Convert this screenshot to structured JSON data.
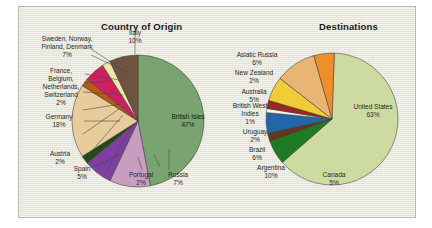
{
  "figure": {
    "background_color": "#e8e7dc",
    "border_color": "#b9b8ad"
  },
  "chart_data": [
    {
      "type": "pie",
      "title": "Country of Origin",
      "position": "left",
      "legend": "labels-outside-with-leader-lines",
      "categories": [
        "British Isles",
        "Italy",
        "Sweden, Norway, Finland, Denmark",
        "France, Belgium, Netherlands, Switzerland",
        "Germany",
        "Austria",
        "Spain",
        "Portugal",
        "Russia"
      ],
      "values": [
        47,
        10,
        7,
        2,
        18,
        2,
        5,
        2,
        7
      ],
      "value_labels": [
        "47%",
        "10%",
        "7%",
        "2%",
        "18%",
        "2%",
        "5%",
        "2%",
        "7%"
      ],
      "colors": [
        "#79a472",
        "#c79ec0",
        "#7e3fa0",
        "#1f4a16",
        "#e8cc9b",
        "#b35c12",
        "#cf1f62",
        "#ece9a8",
        "#6f5240"
      ],
      "labels": [
        {
          "key": "british-isles",
          "text": "British Isles\n47%",
          "placement": "inside"
        },
        {
          "key": "italy",
          "text": "Italy\n10%",
          "placement": "outside"
        },
        {
          "key": "scandinavia",
          "text": "Sweden, Norway,\nFinland, Denmark\n7%",
          "placement": "outside"
        },
        {
          "key": "low-countries",
          "text": "France,\nBelgium,\nNetherlands,\nSwitzerland\n2%",
          "placement": "outside"
        },
        {
          "key": "germany",
          "text": "Germany\n18%",
          "placement": "outside"
        },
        {
          "key": "austria",
          "text": "Austria\n2%",
          "placement": "outside"
        },
        {
          "key": "spain",
          "text": "Spain\n5%",
          "placement": "outside"
        },
        {
          "key": "portugal",
          "text": "Portugal\n2%",
          "placement": "outside"
        },
        {
          "key": "russia",
          "text": "Russia\n7%",
          "placement": "outside"
        }
      ]
    },
    {
      "type": "pie",
      "title": "Destinations",
      "position": "right",
      "legend": "labels-outside-with-leader-lines",
      "categories": [
        "United States",
        "Asiatic Russia",
        "New Zealand",
        "Australia",
        "British West Indies",
        "Uruguay",
        "Brazil",
        "Argentina",
        "Canada"
      ],
      "values": [
        63,
        6,
        2,
        5,
        1,
        2,
        6,
        10,
        5
      ],
      "value_labels": [
        "63%",
        "6%",
        "2%",
        "5%",
        "1%",
        "2%",
        "6%",
        "10%",
        "5%"
      ],
      "colors": [
        "#cedba0",
        "#1f7a24",
        "#63381a",
        "#2166ab",
        "#f4f2ec",
        "#9c2620",
        "#f0cb3a",
        "#e8b575",
        "#ef8f2b"
      ],
      "labels": [
        {
          "key": "united-states",
          "text": "United States\n63%",
          "placement": "inside"
        },
        {
          "key": "asiatic-russia",
          "text": "Asiatic Russia\n6%",
          "placement": "outside"
        },
        {
          "key": "new-zealand",
          "text": "New Zealand\n2%",
          "placement": "outside"
        },
        {
          "key": "australia",
          "text": "Australia\n5%",
          "placement": "outside"
        },
        {
          "key": "british-west-indies",
          "text": "British West\nIndies\n1%",
          "placement": "outside"
        },
        {
          "key": "uruguay",
          "text": "Uruguay\n2%",
          "placement": "outside"
        },
        {
          "key": "brazil",
          "text": "Brazil\n6%",
          "placement": "outside"
        },
        {
          "key": "argentina",
          "text": "Argentina\n10%",
          "placement": "outside"
        },
        {
          "key": "canada",
          "text": "Canada\n5%",
          "placement": "outside"
        }
      ]
    }
  ]
}
